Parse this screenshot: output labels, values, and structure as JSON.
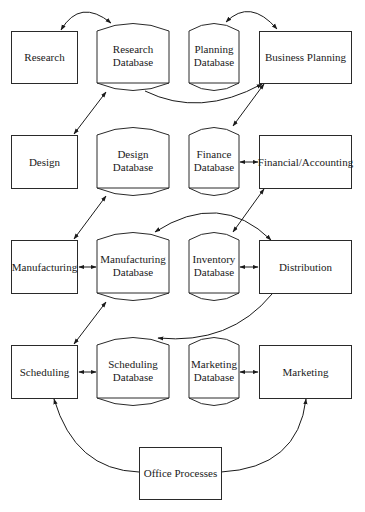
{
  "diagram": {
    "processes": [
      {
        "id": "research",
        "label": "Research"
      },
      {
        "id": "business_planning",
        "label": "Business Planning"
      },
      {
        "id": "design",
        "label": "Design"
      },
      {
        "id": "financial_accounting",
        "label": "Financial/Accounting"
      },
      {
        "id": "manufacturing",
        "label": "Manufacturing"
      },
      {
        "id": "distribution",
        "label": "Distribution"
      },
      {
        "id": "scheduling",
        "label": "Scheduling"
      },
      {
        "id": "marketing",
        "label": "Marketing"
      },
      {
        "id": "office_processes",
        "label": "Office Processes"
      }
    ],
    "databases": [
      {
        "id": "research_db",
        "line1": "Research",
        "line2": "Database"
      },
      {
        "id": "planning_db",
        "line1": "Planning",
        "line2": "Database"
      },
      {
        "id": "design_db",
        "line1": "Design",
        "line2": "Database"
      },
      {
        "id": "finance_db",
        "line1": "Finance",
        "line2": "Database"
      },
      {
        "id": "manufacturing_db",
        "line1": "Manufacturing",
        "line2": "Database"
      },
      {
        "id": "inventory_db",
        "line1": "Inventory",
        "line2": "Database"
      },
      {
        "id": "scheduling_db",
        "line1": "Scheduling",
        "line2": "Database"
      },
      {
        "id": "marketing_db",
        "line1": "Marketing",
        "line2": "Database"
      }
    ],
    "connections": [
      {
        "from": "research",
        "to": "research_db",
        "type": "bidirectional-curve"
      },
      {
        "from": "planning_db",
        "to": "business_planning",
        "type": "bidirectional-curve"
      },
      {
        "from": "research_db",
        "to": "business_planning",
        "type": "curve-arrow"
      },
      {
        "from": "design",
        "to": "research_db",
        "type": "bidirectional"
      },
      {
        "from": "business_planning",
        "to": "finance_db",
        "type": "bidirectional"
      },
      {
        "from": "finance_db",
        "to": "financial_accounting",
        "type": "bidirectional"
      },
      {
        "from": "design_db",
        "to": "manufacturing",
        "type": "bidirectional"
      },
      {
        "from": "financial_accounting",
        "to": "inventory_db",
        "type": "bidirectional"
      },
      {
        "from": "distribution",
        "to": "manufacturing_db",
        "type": "bidirectional-curve"
      },
      {
        "from": "manufacturing",
        "to": "manufacturing_db",
        "type": "bidirectional"
      },
      {
        "from": "inventory_db",
        "to": "distribution",
        "type": "bidirectional"
      },
      {
        "from": "manufacturing_db",
        "to": "scheduling",
        "type": "bidirectional"
      },
      {
        "from": "distribution",
        "to": "scheduling_db",
        "type": "curve-arrow"
      },
      {
        "from": "scheduling",
        "to": "scheduling_db",
        "type": "bidirectional"
      },
      {
        "from": "marketing_db",
        "to": "marketing",
        "type": "bidirectional"
      },
      {
        "from": "office_processes",
        "to": "scheduling",
        "type": "curve-arrow"
      },
      {
        "from": "office_processes",
        "to": "marketing",
        "type": "curve-arrow"
      }
    ]
  }
}
